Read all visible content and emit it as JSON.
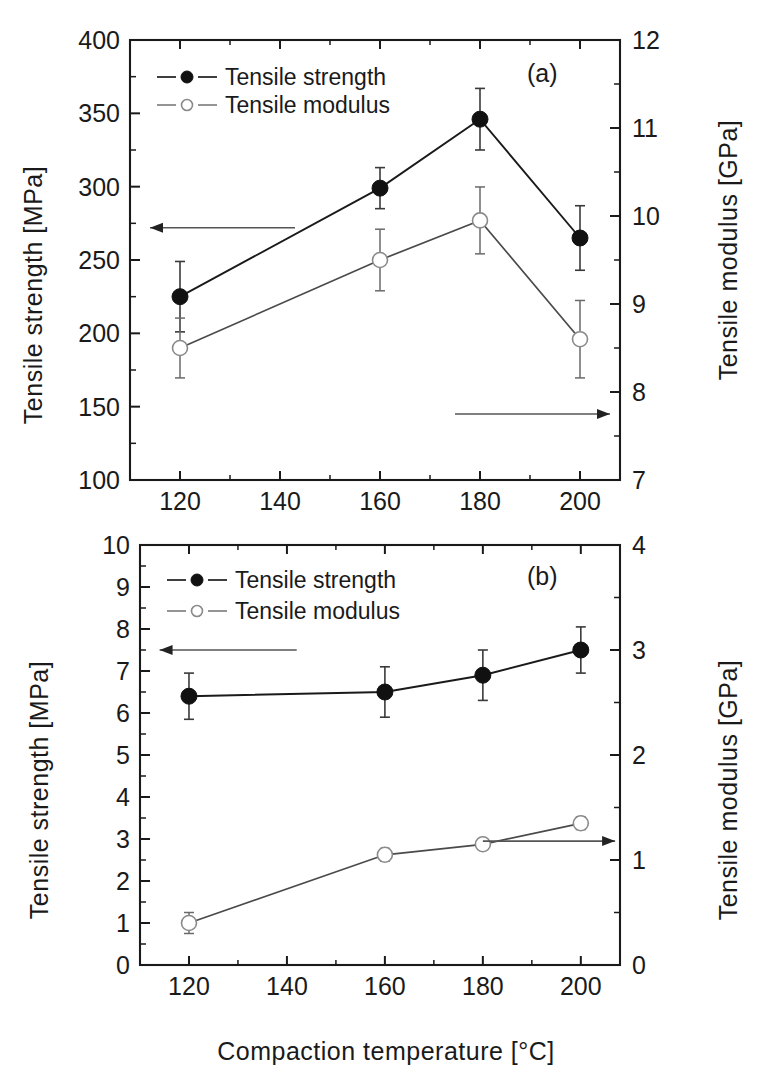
{
  "figure": {
    "xlabel": "Compaction temperature [°C]",
    "x_ticks": [
      "120",
      "140",
      "160",
      "180",
      "200"
    ],
    "x_values": [
      120,
      140,
      160,
      180,
      200
    ],
    "xlim": [
      110,
      208
    ]
  },
  "panel_a": {
    "label": "(a)",
    "ylabel_left": "Tensile strength [MPa]",
    "ylabel_right": "Tensile modulus [GPa]",
    "y_left_ticks": [
      "100",
      "150",
      "200",
      "250",
      "300",
      "350",
      "400"
    ],
    "y_right_ticks": [
      "7",
      "8",
      "9",
      "10",
      "11",
      "12"
    ],
    "legend": [
      {
        "label": "Tensile strength",
        "marker": "filled-circle"
      },
      {
        "label": "Tensile modulus",
        "marker": "open-circle"
      }
    ],
    "arrow_left_label": "arrow-pointing-to-left-axis",
    "arrow_right_label": "arrow-pointing-to-right-axis"
  },
  "panel_b": {
    "label": "(b)",
    "ylabel_left": "Tensile strength [MPa]",
    "ylabel_right": "Tensile modulus [GPa]",
    "y_left_ticks": [
      "0",
      "1",
      "2",
      "3",
      "4",
      "5",
      "6",
      "7",
      "8",
      "9",
      "10"
    ],
    "y_right_ticks": [
      "0",
      "1",
      "2",
      "3",
      "4"
    ],
    "legend": [
      {
        "label": "Tensile strength",
        "marker": "filled-circle"
      },
      {
        "label": "Tensile modulus",
        "marker": "open-circle"
      }
    ],
    "arrow_left_label": "arrow-pointing-to-left-axis",
    "arrow_right_label": "arrow-pointing-to-right-axis"
  },
  "chart_data": [
    {
      "type": "line",
      "title": "(a)",
      "xlabel": "Compaction temperature [°C]",
      "ylabel": "Tensile strength [MPa]",
      "ylabel_right": "Tensile modulus [GPa]",
      "x": [
        120,
        160,
        180,
        200
      ],
      "xlim": [
        110,
        208
      ],
      "ylim": [
        100,
        400
      ],
      "ylim_right": [
        7,
        12
      ],
      "grid": false,
      "legend_position": "upper-left",
      "series": [
        {
          "name": "Tensile strength",
          "axis": "left",
          "unit": "MPa",
          "marker": "filled-circle",
          "values": [
            225,
            299,
            346,
            265
          ],
          "yerr": [
            24,
            14,
            21,
            22
          ]
        },
        {
          "name": "Tensile modulus",
          "axis": "right",
          "unit": "GPa",
          "marker": "open-circle",
          "values": [
            8.5,
            9.5,
            9.95,
            8.6
          ],
          "yerr": [
            0.34,
            0.35,
            0.38,
            0.44
          ]
        }
      ]
    },
    {
      "type": "line",
      "title": "(b)",
      "xlabel": "Compaction temperature [°C]",
      "ylabel": "Tensile strength [MPa]",
      "ylabel_right": "Tensile modulus [GPa]",
      "x": [
        120,
        160,
        180,
        200
      ],
      "xlim": [
        110,
        208
      ],
      "ylim": [
        0,
        10
      ],
      "ylim_right": [
        0,
        4
      ],
      "grid": false,
      "legend_position": "upper-left",
      "series": [
        {
          "name": "Tensile strength",
          "axis": "left",
          "unit": "MPa",
          "marker": "filled-circle",
          "values": [
            6.4,
            6.5,
            6.9,
            7.5
          ],
          "yerr": [
            0.55,
            0.6,
            0.6,
            0.55
          ]
        },
        {
          "name": "Tensile modulus",
          "axis": "right",
          "unit": "GPa",
          "marker": "open-circle",
          "values": [
            0.4,
            1.05,
            1.15,
            1.35
          ],
          "yerr": [
            0.1,
            0.06,
            0.05,
            0.06
          ]
        }
      ]
    }
  ]
}
